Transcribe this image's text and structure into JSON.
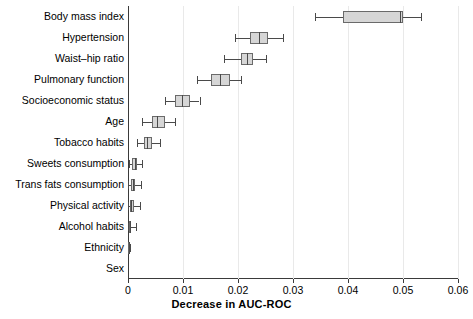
{
  "chart_data": {
    "type": "boxplot",
    "title": "",
    "xlabel": "Decrease in AUC-ROC",
    "ylabel": "",
    "xlim": [
      0,
      0.06
    ],
    "xticks": [
      "0",
      "0.01",
      "0.02",
      "0.03",
      "0.04",
      "0.05",
      "0.06"
    ],
    "xtick_values": [
      0,
      0.01,
      0.02,
      0.03,
      0.04,
      0.05,
      0.06
    ],
    "grid": "vertical",
    "legend": "none",
    "orientation": "horizontal",
    "categories": [
      "Body mass index",
      "Hypertension",
      "Waist–hip ratio",
      "Pulmonary function",
      "Socioeconomic status",
      "Age",
      "Tobacco habits",
      "Sweets consumption",
      "Trans fats consumption",
      "Physical activity",
      "Alcohol habits",
      "Ethnicity",
      "Sex"
    ],
    "boxes": [
      {
        "label": "Body mass index",
        "whisker_low": 0.034,
        "q1": 0.039,
        "median": 0.0495,
        "q3": 0.05,
        "whisker_high": 0.0532
      },
      {
        "label": "Hypertension",
        "whisker_low": 0.0195,
        "q1": 0.0222,
        "median": 0.0238,
        "q3": 0.0255,
        "whisker_high": 0.0282
      },
      {
        "label": "Waist–hip ratio",
        "whisker_low": 0.0175,
        "q1": 0.0205,
        "median": 0.0216,
        "q3": 0.0228,
        "whisker_high": 0.025
      },
      {
        "label": "Pulmonary function",
        "whisker_low": 0.0125,
        "q1": 0.015,
        "median": 0.0167,
        "q3": 0.0185,
        "whisker_high": 0.0205
      },
      {
        "label": "Socioeconomic status",
        "whisker_low": 0.0068,
        "q1": 0.0085,
        "median": 0.0098,
        "q3": 0.0113,
        "whisker_high": 0.013
      },
      {
        "label": "Age",
        "whisker_low": 0.0025,
        "q1": 0.0043,
        "median": 0.0053,
        "q3": 0.0067,
        "whisker_high": 0.0085
      },
      {
        "label": "Tobacco habits",
        "whisker_low": 0.0016,
        "q1": 0.0029,
        "median": 0.0035,
        "q3": 0.0044,
        "whisker_high": 0.0058
      },
      {
        "label": "Sweets consumption",
        "whisker_low": 0.0002,
        "q1": 0.0008,
        "median": 0.0012,
        "q3": 0.0016,
        "whisker_high": 0.0026
      },
      {
        "label": "Trans fats consumption",
        "whisker_low": 0.0,
        "q1": 0.0005,
        "median": 0.0009,
        "q3": 0.0013,
        "whisker_high": 0.0024
      },
      {
        "label": "Physical activity",
        "whisker_low": 0.0,
        "q1": 0.0003,
        "median": 0.0006,
        "q3": 0.0011,
        "whisker_high": 0.0021
      },
      {
        "label": "Alcohol habits",
        "whisker_low": 0.0,
        "q1": 0.0001,
        "median": 0.0003,
        "q3": 0.0005,
        "whisker_high": 0.0014
      },
      {
        "label": "Ethnicity",
        "whisker_low": 0.0,
        "q1": 0.0,
        "median": 0.0001,
        "q3": 0.0002,
        "whisker_high": 0.0004
      },
      {
        "label": "Sex",
        "whisker_low": 0.0,
        "q1": 0.0,
        "median": 0.0,
        "q3": 0.0,
        "whisker_high": 0.0
      }
    ]
  },
  "colors": {
    "box_fill": "#d6d6d6",
    "box_edge": "#6a6a6a",
    "axis": "#3a3a3a",
    "grid": "#e9e9e9",
    "background": "#ffffff"
  }
}
